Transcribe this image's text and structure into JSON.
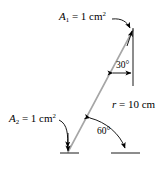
{
  "figure": {
    "background_color": "#ffffff",
    "ink_color": "#000000",
    "ray_color": "#a6a6a6",
    "width": 164,
    "height": 170,
    "labels": {
      "area1": {
        "symbol": "A",
        "subscript": "1",
        "equals": " = 1 cm",
        "exponent": "2"
      },
      "area2": {
        "symbol": "A",
        "subscript": "2",
        "equals": " = 1 cm",
        "exponent": "2"
      },
      "distance": {
        "symbol": "r",
        "equals": " = 10 cm"
      },
      "angle_top": "30°",
      "angle_bottom": "60°"
    },
    "geometry": {
      "ray_start": [
        68,
        152
      ],
      "ray_end": [
        133,
        30
      ],
      "vertical_reference_x": 133,
      "vertical_reference_y1": 30,
      "vertical_reference_y2": 86,
      "baseline_left": [
        61,
        153,
        79,
        153
      ],
      "baseline_right": [
        110,
        153,
        140,
        153
      ],
      "angle_top_degrees": 30,
      "angle_bottom_degrees": 60
    }
  }
}
